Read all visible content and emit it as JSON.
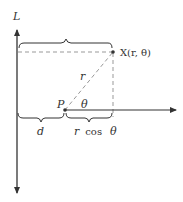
{
  "diagram": {
    "colors": {
      "line": "#333333",
      "dashed": "#999999",
      "background": "#ffffff"
    },
    "labels": {
      "line_L": "L",
      "point_X": "X(r, θ)",
      "point_P": "P",
      "radius": "r",
      "angle": "θ",
      "distance_d": "d",
      "r_cos": "r cos",
      "r_cos_theta": "θ"
    },
    "elements": [
      "vertical line L with arrows at both ends",
      "horizontal polar axis ray from pole P",
      "point X at polar coordinates (r, θ)",
      "dashed segment P to X (length r)",
      "dashed perpendicular from X to polar axis",
      "dashed horizontal from X to line L",
      "brace over total distance from L to X",
      "brace d from L to P",
      "brace r cos θ from P to foot of perpendicular"
    ]
  }
}
